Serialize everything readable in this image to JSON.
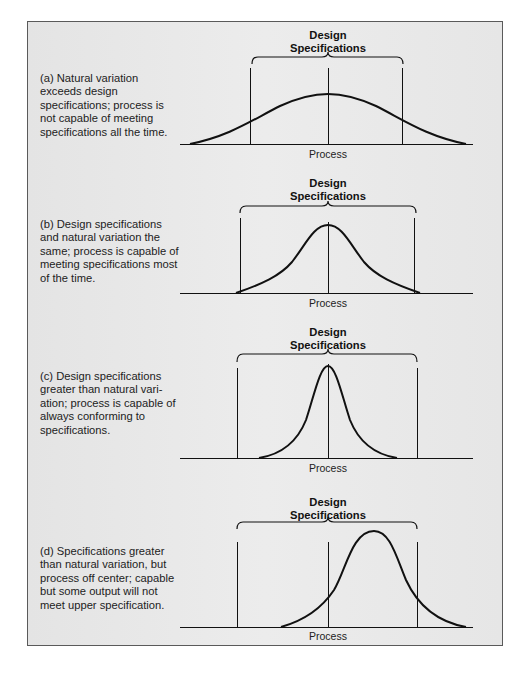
{
  "figure": {
    "panels": [
      {
        "id": "a",
        "description": "(a) Natural variation exceeds design specifications; process is not capable of meeting specifications all the time.",
        "title_line1": "Design",
        "title_line2": "Specifications",
        "axis_label": "Process"
      },
      {
        "id": "b",
        "description": "(b) Design specifications and natural variation the same; process is capable of meeting specifications most of the time.",
        "title_line1": "Design",
        "title_line2": "Specifications",
        "axis_label": "Process"
      },
      {
        "id": "c",
        "description": "(c) Design specifications greater than natural vari-ation; process is capable of always conforming to specifications.",
        "title_line1": "Design",
        "title_line2": "Specifications",
        "axis_label": "Process"
      },
      {
        "id": "d",
        "description": "(d) Specifications greater than natural variation, but process off center; capable but some output will not meet upper specification.",
        "title_line1": "Design",
        "title_line2": "Specifications",
        "axis_label": "Process"
      }
    ],
    "colors": {
      "background": "#e8e8e8",
      "border": "#5a5a5a",
      "line": "#111111"
    }
  }
}
